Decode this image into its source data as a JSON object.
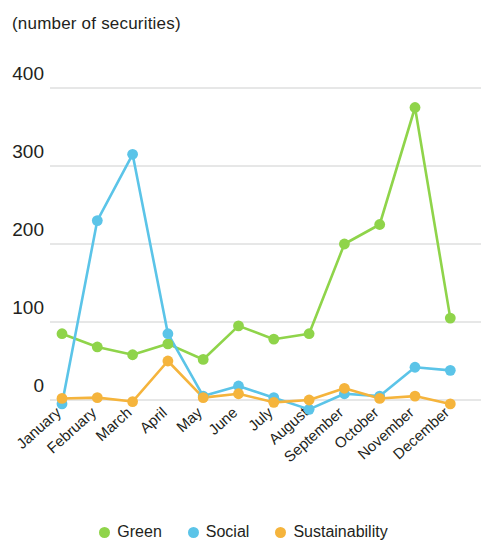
{
  "axis_note": "(number of securities)",
  "legend": {
    "items": [
      {
        "label": "Green",
        "color": "#8fd44a"
      },
      {
        "label": "Social",
        "color": "#5bc4e8"
      },
      {
        "label": "Sustainability",
        "color": "#f5b43c"
      }
    ]
  },
  "chart_data": {
    "type": "line",
    "title": "",
    "subtitle": "",
    "xlabel": "",
    "ylabel": "(number of securities)",
    "categories": [
      "January",
      "February",
      "March",
      "April",
      "May",
      "June",
      "July",
      "August",
      "September",
      "October",
      "November",
      "December"
    ],
    "yticks": [
      0,
      100,
      200,
      300,
      400
    ],
    "ylim": [
      -20,
      400
    ],
    "grid": true,
    "legend_position": "bottom-center",
    "series": [
      {
        "name": "Green",
        "color": "#8fd44a",
        "values": [
          85,
          68,
          58,
          72,
          52,
          95,
          78,
          85,
          200,
          225,
          375,
          105
        ]
      },
      {
        "name": "Social",
        "color": "#5bc4e8",
        "values": [
          -5,
          230,
          315,
          85,
          5,
          18,
          3,
          -12,
          8,
          5,
          42,
          38
        ]
      },
      {
        "name": "Sustainability",
        "color": "#f5b43c",
        "values": [
          2,
          3,
          -2,
          50,
          3,
          8,
          -3,
          0,
          15,
          2,
          5,
          -5
        ]
      }
    ]
  }
}
